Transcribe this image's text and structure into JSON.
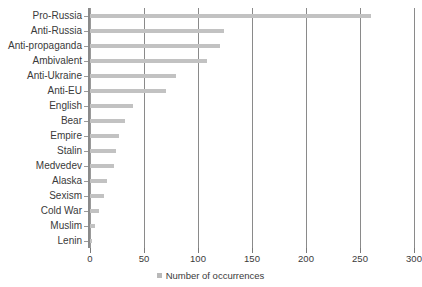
{
  "chart_data": {
    "type": "bar",
    "orientation": "horizontal",
    "title": "Main clusters of Crimean memes",
    "xlabel": "",
    "ylabel": "",
    "xlim": [
      0,
      300
    ],
    "xticks": [
      0,
      50,
      100,
      150,
      200,
      250,
      300
    ],
    "grid": true,
    "legend_position": "bottom-center",
    "categories": [
      "Pro-Russia",
      "Anti-Russia",
      "Anti-propaganda",
      "Ambivalent",
      "Anti-Ukraine",
      "Anti-EU",
      "English",
      "Bear",
      "Empire",
      "Stalin",
      "Medvedev",
      "Alaska",
      "Sexism",
      "Cold War",
      "Muslim",
      "Lenin"
    ],
    "series": [
      {
        "name": "Number of occurrences",
        "color": "#c2c2c2",
        "values": [
          260,
          124,
          120,
          108,
          80,
          70,
          40,
          32,
          27,
          24,
          22,
          16,
          13,
          8,
          5,
          2
        ]
      }
    ]
  },
  "legend": {
    "label": "Number of occurrences"
  },
  "axis": {
    "tick_labels": [
      "0",
      "50",
      "100",
      "150",
      "200",
      "250",
      "300"
    ]
  }
}
